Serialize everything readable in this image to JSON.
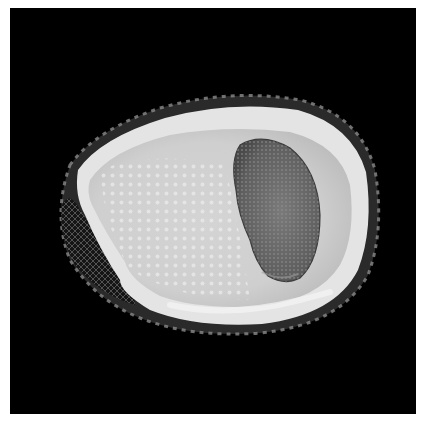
{
  "image": {
    "subject": "shell-aperture-view",
    "background_color": "#000000",
    "border_color": "#ffffff",
    "shell_body_color": "#d9d9d9",
    "shell_rim_color": "#e6e6e6",
    "operculum_color": "#6e6e6e",
    "spire_color": "#1f1f1f"
  }
}
